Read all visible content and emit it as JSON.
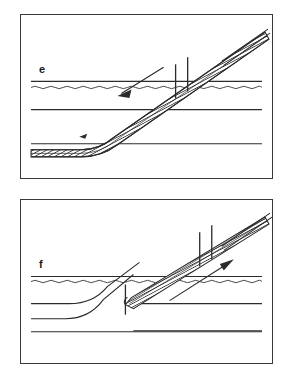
{
  "figure": {
    "caption_absent": true,
    "panel_count": 2,
    "stroke_color": "#2b2b2b",
    "frame_color": "#3a3a3a",
    "background_color": "#ffffff",
    "hatch_color": "#333333"
  },
  "panels": [
    {
      "id": "e",
      "label": "e",
      "label_x": 18,
      "label_y": 68,
      "arrow": {
        "name": "retraction-arrow",
        "direction": "down-left",
        "meaning": "withdraw",
        "x1": 168,
        "y1": 40,
        "x2": 108,
        "y2": 72
      },
      "device": {
        "name": "sheath-over-guidewire",
        "angle_deg": -27,
        "hatched": true,
        "tip_x": 40,
        "tip_y": 133,
        "hub_x": 236,
        "hub_y": 22
      },
      "markers": [
        {
          "name": "marker-band-proximal",
          "x": 156,
          "y": 37
        },
        {
          "name": "marker-band-distal",
          "x": 168,
          "y": 31
        }
      ],
      "tissue_lines": [
        {
          "name": "tissue-plane-wavy",
          "y": 72,
          "style": "wavy"
        },
        {
          "name": "tissue-plane-upper",
          "y": 68,
          "style": "straight"
        },
        {
          "name": "tissue-plane-middle",
          "y": 93,
          "style": "straight"
        },
        {
          "name": "tissue-plane-lower",
          "y": 127,
          "style": "straight"
        }
      ]
    },
    {
      "id": "f",
      "label": "f",
      "label_x": 18,
      "label_y": 60,
      "arrow": {
        "name": "advancement-arrow",
        "direction": "up-right",
        "meaning": "advance",
        "x1": 148,
        "y1": 96,
        "x2": 212,
        "y2": 58
      },
      "device": {
        "name": "sheath-over-guidewire",
        "angle_deg": -27,
        "hatched": true,
        "tip_x": 112,
        "tip_y": 102,
        "hub_x": 236,
        "hub_y": 22
      },
      "markers": [
        {
          "name": "marker-band-proximal",
          "x": 108,
          "y": 95
        },
        {
          "name": "marker-band-distal",
          "x": 180,
          "y": 48
        },
        {
          "name": "marker-band-distal-2",
          "x": 192,
          "y": 42
        }
      ],
      "tissue_lines": [
        {
          "name": "tissue-plane-wavy",
          "y": 78,
          "style": "wavy"
        },
        {
          "name": "tissue-plane-upper",
          "y": 74,
          "style": "straight"
        },
        {
          "name": "tissue-plane-middle",
          "y": 100,
          "style": "curved"
        },
        {
          "name": "tissue-plane-lower",
          "y": 118,
          "style": "curved"
        },
        {
          "name": "tissue-plane-base",
          "y": 132,
          "style": "straight"
        }
      ]
    }
  ]
}
